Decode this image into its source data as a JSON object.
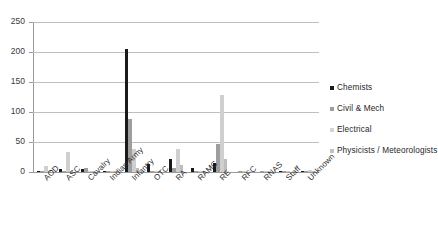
{
  "chart_data": {
    "type": "bar",
    "title": "",
    "subtitle": "",
    "xlabel": "",
    "ylabel": "",
    "ylim": [
      0,
      250
    ],
    "yticks": [
      0,
      50,
      100,
      150,
      200,
      250
    ],
    "grid": true,
    "legend_position": "right",
    "categories": [
      "AOD",
      "ASC",
      "Cavalry",
      "Indian Army",
      "Infantry",
      "OTC",
      "RA",
      "RAMC",
      "RE",
      "RFC",
      "RNAS",
      "Staff",
      "Unknown"
    ],
    "series": [
      {
        "name": "Chemists",
        "color": "#1a1a1a",
        "values": [
          1,
          5,
          5,
          1,
          205,
          14,
          22,
          6,
          15,
          0,
          0,
          1,
          1
        ]
      },
      {
        "name": "Civil & Mech",
        "color": "#9e9e9e",
        "values": [
          2,
          2,
          7,
          2,
          88,
          1,
          6,
          1,
          47,
          1,
          1,
          1,
          2
        ]
      },
      {
        "name": "Electrical",
        "color": "#cfcfcf",
        "values": [
          10,
          34,
          2,
          2,
          38,
          2,
          38,
          2,
          128,
          2,
          2,
          1,
          3
        ]
      },
      {
        "name": "Physicists / Meteorologists",
        "color": "#bdbdbd",
        "values": [
          1,
          1,
          1,
          1,
          7,
          1,
          11,
          1,
          22,
          0,
          1,
          0,
          1
        ]
      }
    ]
  },
  "legend": {
    "items": [
      {
        "label": "Chemists",
        "color": "#1a1a1a"
      },
      {
        "label": "Civil & Mech",
        "color": "#9e9e9e"
      },
      {
        "label": "Electrical",
        "color": "#d4d4d4"
      },
      {
        "label": "Physicists / Meteorologists",
        "color": "#c2c2c2"
      }
    ]
  },
  "axis": {
    "y_tick_labels": [
      "0",
      "50",
      "100",
      "150",
      "200",
      "250"
    ]
  }
}
